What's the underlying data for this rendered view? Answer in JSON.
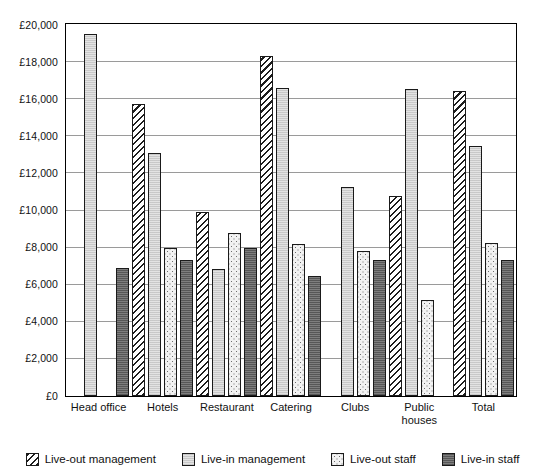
{
  "chart_data": {
    "type": "bar",
    "title": "",
    "xlabel": "",
    "ylabel": "",
    "ylim": [
      0,
      20000
    ],
    "ytick_step": 2000,
    "ytick_labels": [
      "£20,000",
      "£18,000",
      "£16,000",
      "£14,000",
      "£12,000",
      "£10,000",
      "£8,000",
      "£6,000",
      "£4,000",
      "£2,000",
      "£0"
    ],
    "ytick_values": [
      20000,
      18000,
      16000,
      14000,
      12000,
      10000,
      8000,
      6000,
      4000,
      2000,
      0
    ],
    "grid": true,
    "legend_position": "bottom",
    "currency_symbol": "£",
    "categories": [
      "Head office",
      "Hotels",
      "Restaurant",
      "Catering",
      "Clubs",
      "Public\nhouses",
      "Total"
    ],
    "series": [
      {
        "name": "Live-out management",
        "pattern": "diagonal-hatch",
        "color": "#ffffff",
        "values": [
          null,
          15700,
          9900,
          18300,
          null,
          10750,
          16400
        ]
      },
      {
        "name": "Live-in management",
        "pattern": "light-solid",
        "color": "#e3e3e3",
        "values": [
          19500,
          13100,
          6800,
          16600,
          11250,
          16550,
          13450
        ]
      },
      {
        "name": "Live-out staff",
        "pattern": "dotted",
        "color": "#f2f2f2",
        "values": [
          null,
          7950,
          8750,
          8150,
          7800,
          5150,
          8200
        ]
      },
      {
        "name": "Live-in staff",
        "pattern": "dark-solid",
        "color": "#6f6f6f",
        "values": [
          6900,
          7300,
          7950,
          6450,
          7300,
          null,
          7300
        ]
      }
    ]
  },
  "legend": {
    "items": [
      {
        "label": "Live-out management"
      },
      {
        "label": "Live-in management"
      },
      {
        "label": "Live-out staff"
      },
      {
        "label": "Live-in staff"
      }
    ]
  }
}
